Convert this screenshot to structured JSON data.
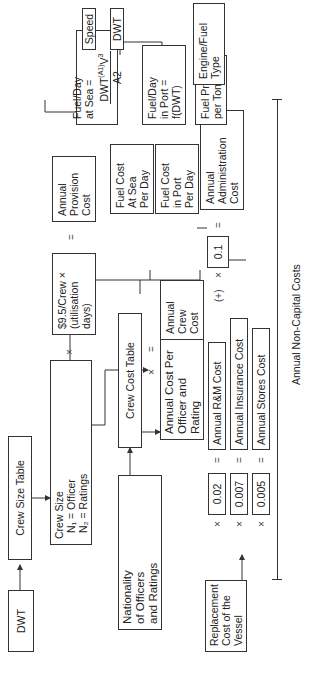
{
  "input_dwt": "DWT",
  "crew_size_table": "Crew Size Table",
  "crew_size": {
    "title": "Crew Size",
    "n1": "N₁  =  Officer",
    "n2": "N₂  =  Ratings"
  },
  "nationality": [
    "Nationality",
    "of Officers",
    "and Ratings"
  ],
  "crew_cost_table": "Crew Cost Table",
  "annual_cost_per_officer": [
    "Annual Cost Per",
    "Officer and",
    "Rating"
  ],
  "provision_formula": [
    "$9.5/Crew  ×",
    "(utilisation",
    "days)"
  ],
  "annual_provision_cost": [
    "Annual",
    "Provision",
    "Cost"
  ],
  "annual_crew_cost": [
    "Annual",
    "Crew",
    "Cost"
  ],
  "admin_factor": "0.1",
  "annual_administration_cost": [
    "Annual",
    "Administration",
    "Cost"
  ],
  "speed": "Speed",
  "dwt_top": "DWT",
  "engine_fuel_type": [
    "Engine/Fuel",
    "Type"
  ],
  "fuel_day_sea": {
    "line1": "Fuel/Day",
    "line2": "at Sea =",
    "numerator": "DWT",
    "exp": "(A1)",
    "v": "V",
    "v_exp": "3",
    "denominator": "A2"
  },
  "fuel_day_port": [
    "Fuel/Day",
    "in Port =",
    "f(DWT)"
  ],
  "fuel_price": [
    "Fuel Price",
    "per Tonne"
  ],
  "fuel_cost_sea": [
    "Fuel Cost",
    "At Sea",
    "Per Day"
  ],
  "fuel_cost_port": [
    "Fuel Cost",
    "in Port",
    "Per Day"
  ],
  "replacement_cost": [
    "Replacement",
    "Cost of the",
    "Vessel"
  ],
  "factors": [
    "0.02",
    "0.007",
    "0.005"
  ],
  "annual_costs": [
    "Annual R&M Cost",
    "Annual Insurance Cost",
    "Annual Stores Cost"
  ],
  "operators": {
    "times": "×",
    "equals": "=",
    "plus": "(+)"
  },
  "bracket_label": "Annual Non-Capital Costs"
}
